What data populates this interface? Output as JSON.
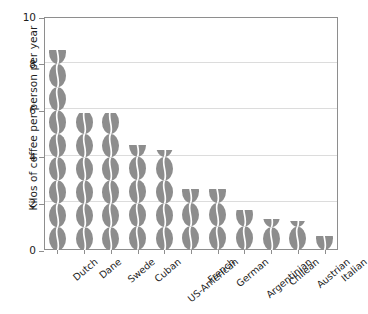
{
  "chart_data": {
    "type": "bar",
    "title": "",
    "xlabel": "",
    "ylabel": "Kilos of coffee per person per year",
    "categories": [
      "Dutch",
      "Dane",
      "Swede",
      "Cuban",
      "US-American",
      "French",
      "German",
      "Argentinian",
      "Chilean",
      "Austrian",
      "Italian"
    ],
    "values": [
      8.6,
      5.9,
      5.9,
      4.5,
      4.3,
      2.6,
      2.6,
      1.7,
      1.35,
      1.25,
      0.6
    ],
    "ylim": [
      0,
      10
    ],
    "yticks": [
      0,
      2,
      4,
      6,
      8,
      10
    ],
    "ytick_labels": [
      "0",
      "2",
      "4",
      "6",
      "8",
      "10"
    ],
    "grid": true,
    "legend": "none",
    "bar_style": "stacked-coffee-bean pictogram",
    "bar_color": "#8d8d8d",
    "grid_color": "#dcdcdc",
    "axis_color": "#8e8e8e"
  },
  "axis": {
    "y_title": "Kilos of coffee per person per year"
  }
}
